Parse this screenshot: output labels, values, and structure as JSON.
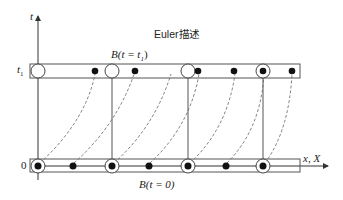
{
  "diagram": {
    "title": "Euler描述",
    "axes": {
      "vertical_label": "t",
      "horizontal_label": "x, X",
      "tick_t1": "t",
      "tick_t1_sub": "1",
      "tick_zero": "0"
    },
    "bodies": {
      "top_label": "B(t = t",
      "top_label_sub": "1",
      "top_label_end": ")",
      "bottom_label": "B(t = 0)"
    },
    "colors": {
      "line": "#555555",
      "dot": "#111111",
      "dashed": "#666666"
    }
  }
}
